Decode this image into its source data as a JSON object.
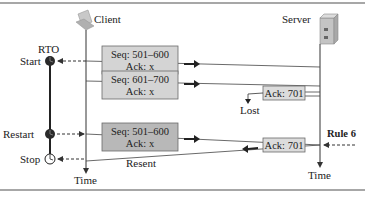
{
  "diagram": {
    "type": "sequence-diagram",
    "colors": {
      "segment_box_fill": "#d4d4d4",
      "segment_box_stroke": "#6a6a6a",
      "resent_box_fill": "#b8b8b8",
      "ack_box_fill": "#dcdcdc",
      "line": "#333333",
      "timer_fill": "#2a2a2a",
      "rule_color": "#8a8a8a"
    },
    "client": {
      "label": "Client",
      "icon": "laptop-icon",
      "time_label": "Time"
    },
    "server": {
      "label": "Server",
      "icon": "server-tower-icon",
      "time_label": "Time"
    },
    "timer": {
      "title": "RTO",
      "events": [
        {
          "label": "Start",
          "state": "running"
        },
        {
          "label": "Restart",
          "state": "running"
        },
        {
          "label": "Stop",
          "state": "stopped"
        }
      ]
    },
    "segments": [
      {
        "seq": "Seq: 501–600",
        "ack": "Ack: x",
        "direction": "client-to-server",
        "style": "normal"
      },
      {
        "seq": "Seq: 601–700",
        "ack": "Ack: x",
        "direction": "client-to-server",
        "style": "normal"
      },
      {
        "seq": "Seq: 501–600",
        "ack": "Ack: x",
        "direction": "client-to-server",
        "style": "resent"
      }
    ],
    "acks": [
      {
        "label": "Ack: 701",
        "direction": "server-to-client",
        "fate": "lost"
      },
      {
        "label": "Ack: 701",
        "direction": "server-to-client",
        "fate": "delivered"
      }
    ],
    "annotations": {
      "lost": "Lost",
      "resent": "Resent",
      "rule": "Rule 6"
    }
  }
}
